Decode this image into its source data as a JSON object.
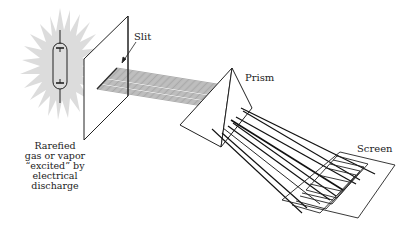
{
  "diagram": {
    "type": "optical-spectroscope-schematic",
    "labels": {
      "slit": "Slit",
      "prism": "Prism",
      "screen": "Screen",
      "source_lines": [
        "Rarefied",
        "gas or vapor",
        "“excited” by",
        "electrical discharge"
      ]
    },
    "components": [
      "gas discharge tube with glow",
      "slit plate",
      "parallel light beam",
      "prism",
      "dispersed rays",
      "screen with spectral lines"
    ],
    "colors": {
      "line": "#222222",
      "glow": "#d8d8d8",
      "background": "#ffffff"
    }
  }
}
